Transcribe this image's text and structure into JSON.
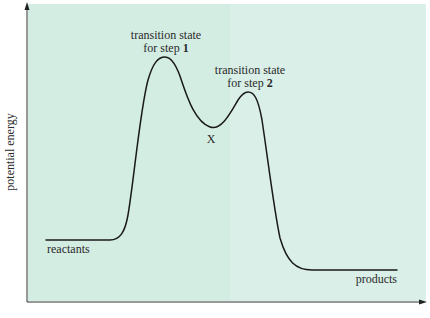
{
  "diagram": {
    "type": "energy-profile",
    "colors": {
      "background": "#d4ede3",
      "curve": "#1a1a1a",
      "axis": "#333333",
      "text": "#2a2a2a"
    },
    "axes": {
      "y_label": "potential energy",
      "x_label": ""
    },
    "labels": {
      "ts1_line1": "transition state",
      "ts1_line2_prefix": "for step ",
      "ts1_step": "1",
      "ts2_line1": "transition state",
      "ts2_line2_prefix": "for step ",
      "ts2_step": "2",
      "intermediate": "X",
      "reactants": "reactants",
      "products": "products"
    },
    "levels": {
      "reactants": "low",
      "transition_state_1": "highest",
      "intermediate_X": "middle",
      "transition_state_2": "high",
      "products": "lowest"
    }
  }
}
